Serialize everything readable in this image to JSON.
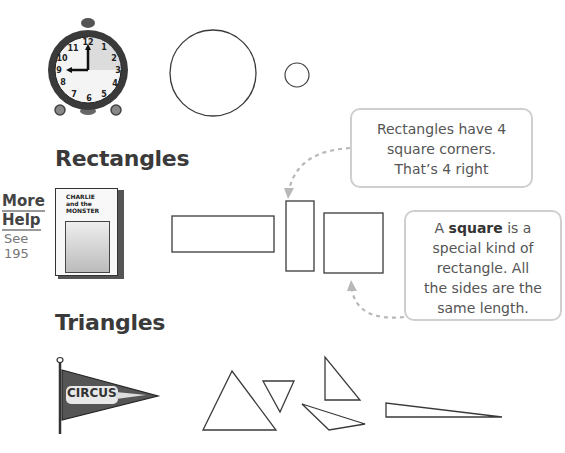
{
  "sections": {
    "circles": {
      "clock": {
        "numbers": [
          "12",
          "1",
          "2",
          "3",
          "4",
          "5",
          "6",
          "7",
          "8",
          "9",
          "10",
          "11"
        ],
        "time": "9:00"
      },
      "shapes": [
        {
          "type": "circle",
          "cx": 213,
          "cy": 73,
          "r": 43
        },
        {
          "type": "circle",
          "cx": 297,
          "cy": 75,
          "r": 12
        }
      ]
    },
    "rectangles": {
      "heading": "Rectangles",
      "more_help": {
        "line1": "More",
        "line2": "Help",
        "see": "See",
        "page": "195"
      },
      "book": {
        "title_line1": "CHARLIE",
        "title_line2": "and the",
        "title_line3": "MONSTER"
      },
      "shapes": [
        {
          "type": "rect",
          "x": 172,
          "y": 216,
          "w": 102,
          "h": 36
        },
        {
          "type": "rect",
          "x": 286,
          "y": 201,
          "w": 28,
          "h": 70
        },
        {
          "type": "square",
          "x": 324,
          "y": 213,
          "w": 59,
          "h": 60
        }
      ],
      "callout_rect": {
        "line1": "Rectangles have 4",
        "line2": "square corners.",
        "line3": "That’s 4 right"
      },
      "callout_square": {
        "pre": "A ",
        "bold": "square",
        "post": " is a",
        "line2": "special kind of",
        "line3": "rectangle. All",
        "line4": "the sides are the",
        "line5": "same length."
      }
    },
    "triangles": {
      "heading": "Triangles",
      "pennant_text": "CIRCUS",
      "shapes": [
        {
          "points": "203,430 232,371 276,430"
        },
        {
          "points": "263,381 294,381 280,412"
        },
        {
          "points": "325,357 325,400 360,400"
        },
        {
          "points": "302,404 349,429 365,421"
        },
        {
          "points": "386,403 386,417 502,417"
        }
      ]
    }
  },
  "colors": {
    "stroke": "#3a3a3a",
    "callout_border": "#cfcfcf",
    "arrow": "#b8b8b8",
    "pennant": "#555555"
  }
}
